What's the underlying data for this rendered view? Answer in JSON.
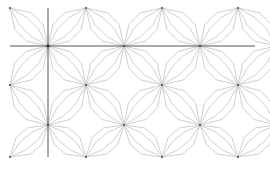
{
  "diagram": {
    "type": "geometric-tiling",
    "colors": {
      "background": "#ffffff",
      "petal_stroke": "#c9c9c9",
      "axis_stroke": "#555555",
      "hub_fill": "#333333"
    },
    "crosshair": {
      "center": [
        48,
        46
      ],
      "vertical": {
        "x": 48,
        "y1": 8,
        "y2": 157
      },
      "horizontal": {
        "y": 46,
        "x1": 10,
        "x2": 255
      }
    },
    "lattice": {
      "col_spacing": 76,
      "row_spacing": 38,
      "rows": [
        {
          "y": 8,
          "xs": [
            10,
            86,
            162,
            238
          ]
        },
        {
          "y": 46,
          "xs": [
            48,
            124,
            200,
            276
          ]
        },
        {
          "y": 85,
          "xs": [
            10,
            86,
            162,
            238
          ]
        },
        {
          "y": 125,
          "xs": [
            48,
            124,
            200,
            276
          ]
        },
        {
          "y": 157,
          "xs": [
            10,
            86,
            162,
            238
          ]
        }
      ]
    },
    "petal": {
      "width_ratio": 0.22,
      "inner_ratio": 0.35
    }
  }
}
